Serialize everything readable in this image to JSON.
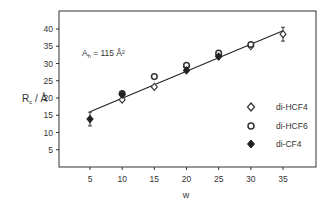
{
  "chart_data": {
    "type": "scatter",
    "title": "",
    "xlabel": "w",
    "ylabel": "R_c / Å",
    "ylabel_main": "R",
    "ylabel_sub": "c",
    "ylabel_unit": " / Å",
    "xlim": [
      0,
      40
    ],
    "ylim": [
      0,
      45
    ],
    "xticks": [
      5,
      10,
      15,
      20,
      25,
      30,
      35
    ],
    "yticks": [
      5,
      10,
      15,
      20,
      25,
      30,
      35,
      40
    ],
    "grid": false,
    "legend_position": "lower right (inside)",
    "annotation": {
      "text_main": "A",
      "text_sub": "h",
      "text_rest": " = 115 Å²",
      "full": "A_h = 115 Å²"
    },
    "series": [
      {
        "name": "di-HCF4",
        "marker": "open-diamond",
        "x": [
          10,
          15,
          20,
          25,
          30,
          35
        ],
        "y": [
          19.5,
          23.2,
          29.0,
          32.5,
          35.0,
          38.5
        ],
        "error": [
          null,
          null,
          null,
          null,
          null,
          2.0
        ]
      },
      {
        "name": "di-HCF6",
        "marker": "open-circle",
        "x": [
          10,
          15,
          20,
          25,
          30
        ],
        "y": [
          21.3,
          26.2,
          29.5,
          33.0,
          35.5
        ]
      },
      {
        "name": "di-CF4",
        "marker": "filled-diamond",
        "x": [
          5,
          10,
          20,
          25
        ],
        "y": [
          13.9,
          21.0,
          28.0,
          32.0
        ],
        "error": [
          2.0,
          null,
          null,
          null
        ]
      }
    ],
    "fit_line": {
      "type": "linear",
      "x": [
        5,
        35
      ],
      "y": [
        16.0,
        39.5
      ]
    }
  },
  "legend": {
    "items": [
      {
        "label": "di-HCF4",
        "marker": "open-diamond"
      },
      {
        "label": "di-HCF6",
        "marker": "open-circle"
      },
      {
        "label": "di-CF4",
        "marker": "filled-diamond"
      }
    ]
  }
}
